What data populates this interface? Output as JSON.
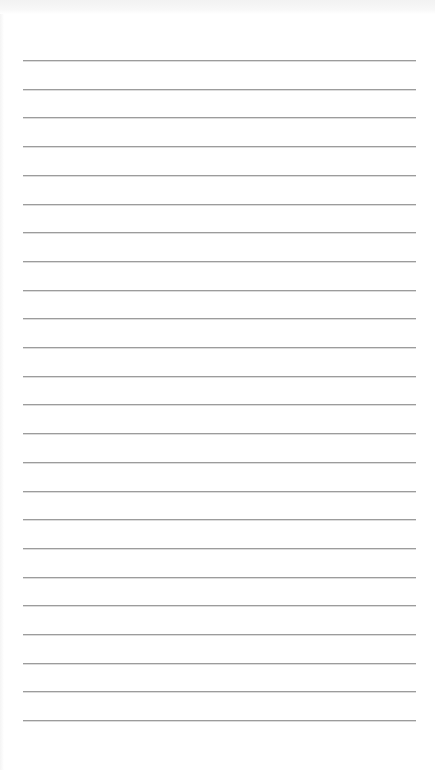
{
  "page": {
    "type": "ruled-notepad",
    "background_color": "#ffffff",
    "status_strip_color": "#f3f3f3",
    "lines": {
      "count": 24,
      "color": "#9c9c9c",
      "x_start": 23,
      "x_end": 416,
      "first_y": 60,
      "spacing": 28.7
    },
    "text_content": []
  }
}
